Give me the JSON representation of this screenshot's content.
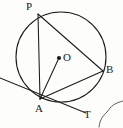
{
  "figure": {
    "kind": "circle-geometry-diagram",
    "background_color": "#fdfdfc",
    "stroke_color": "#1b1b1b",
    "label_color": "#1b1b1b"
  },
  "circle": {
    "name": "main-circle",
    "center_x": 61,
    "center_y": 57,
    "radius": 45,
    "stroke_width": 1.1
  },
  "center_marker": {
    "name": "centre-dot",
    "cx": 59,
    "cy": 58,
    "r": 2.1
  },
  "points": {
    "P": {
      "label": "P",
      "x": 38,
      "y": 14
    },
    "B": {
      "label": "B",
      "x": 103,
      "y": 71
    },
    "A": {
      "label": "A",
      "x": 40,
      "y": 99
    },
    "O": {
      "label": "O",
      "x": 59,
      "y": 58
    },
    "T": {
      "label": "T",
      "x": 83,
      "y": 112
    }
  },
  "segments": [
    {
      "name": "chord-PA",
      "x1": 38,
      "y1": 14,
      "x2": 40,
      "y2": 99
    },
    {
      "name": "chord-PB",
      "x1": 38,
      "y1": 14,
      "x2": 103,
      "y2": 71
    },
    {
      "name": "chord-AB",
      "x1": 40,
      "y1": 99,
      "x2": 103,
      "y2": 71
    },
    {
      "name": "radius-AO",
      "x1": 40,
      "y1": 99,
      "x2": 58,
      "y2": 60
    },
    {
      "name": "tangent-line-AT",
      "x1": 0,
      "y1": 78,
      "x2": 86,
      "y2": 113
    }
  ],
  "stray_mark": {
    "name": "ink-squiggle-artifact",
    "path": "M 99 127 C 100 119, 103 116, 107 112 C 110 108, 112 105, 117 103 C 120 102, 122 101, 123 101"
  }
}
